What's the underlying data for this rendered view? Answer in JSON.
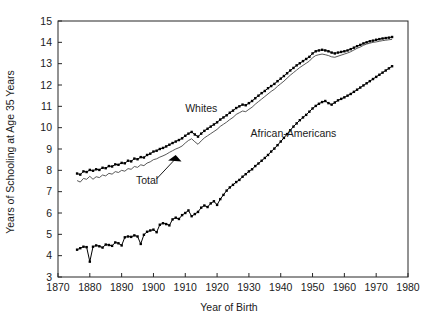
{
  "chart_data": {
    "type": "line",
    "title": "",
    "xlabel": "Year of Birth",
    "ylabel": "Years of Schooling at Age 35 Years",
    "xlim": [
      1870,
      1980
    ],
    "ylim": [
      3,
      15
    ],
    "xticks": [
      1870,
      1880,
      1890,
      1900,
      1910,
      1920,
      1930,
      1940,
      1950,
      1960,
      1970,
      1980
    ],
    "yticks": [
      3,
      4,
      5,
      6,
      7,
      8,
      9,
      10,
      11,
      12,
      13,
      14,
      15
    ],
    "grid": false,
    "legend_position": "inline-annotations",
    "annotations": [
      {
        "text": "Whites",
        "x": 1915,
        "y": 10.75
      },
      {
        "text": "Total",
        "x": 1898,
        "y": 7.35
      },
      {
        "text": "African-Americans",
        "x": 1944,
        "y": 9.55
      }
    ],
    "series": [
      {
        "name": "Whites",
        "marker": "filled-square",
        "x": [
          1876,
          1877,
          1878,
          1879,
          1880,
          1881,
          1882,
          1883,
          1884,
          1885,
          1886,
          1887,
          1888,
          1889,
          1890,
          1891,
          1892,
          1893,
          1894,
          1895,
          1896,
          1897,
          1898,
          1899,
          1900,
          1901,
          1902,
          1903,
          1904,
          1905,
          1906,
          1907,
          1908,
          1909,
          1910,
          1911,
          1912,
          1913,
          1914,
          1915,
          1916,
          1917,
          1918,
          1919,
          1920,
          1921,
          1922,
          1923,
          1924,
          1925,
          1926,
          1927,
          1928,
          1929,
          1930,
          1931,
          1932,
          1933,
          1934,
          1935,
          1936,
          1937,
          1938,
          1939,
          1940,
          1941,
          1942,
          1943,
          1944,
          1945,
          1946,
          1947,
          1948,
          1949,
          1950,
          1951,
          1952,
          1953,
          1954,
          1955,
          1956,
          1957,
          1958,
          1959,
          1960,
          1961,
          1962,
          1963,
          1964,
          1965,
          1966,
          1967,
          1968,
          1969,
          1970,
          1971,
          1972,
          1973,
          1974,
          1975
        ],
        "y": [
          7.85,
          7.8,
          7.95,
          7.92,
          8.02,
          7.98,
          8.05,
          8.02,
          8.12,
          8.1,
          8.2,
          8.18,
          8.28,
          8.26,
          8.35,
          8.33,
          8.45,
          8.42,
          8.55,
          8.52,
          8.62,
          8.6,
          8.72,
          8.78,
          8.88,
          8.92,
          9.0,
          9.05,
          9.12,
          9.2,
          9.28,
          9.35,
          9.42,
          9.5,
          9.62,
          9.72,
          9.8,
          9.68,
          9.58,
          9.72,
          9.85,
          9.95,
          10.05,
          10.15,
          10.25,
          10.38,
          10.48,
          10.58,
          10.7,
          10.8,
          10.92,
          11.0,
          11.08,
          11.05,
          11.15,
          11.25,
          11.38,
          11.5,
          11.62,
          11.72,
          11.85,
          11.95,
          12.05,
          12.18,
          12.3,
          12.42,
          12.55,
          12.68,
          12.8,
          12.92,
          13.02,
          13.12,
          13.22,
          13.32,
          13.48,
          13.58,
          13.62,
          13.65,
          13.62,
          13.58,
          13.52,
          13.48,
          13.52,
          13.55,
          13.58,
          13.62,
          13.68,
          13.75,
          13.82,
          13.88,
          13.95,
          14.0,
          14.05,
          14.08,
          14.12,
          14.15,
          14.18,
          14.2,
          14.22,
          14.25
        ]
      },
      {
        "name": "Total",
        "marker": "none",
        "x": [
          1876,
          1877,
          1878,
          1879,
          1880,
          1881,
          1882,
          1883,
          1884,
          1885,
          1886,
          1887,
          1888,
          1889,
          1890,
          1891,
          1892,
          1893,
          1894,
          1895,
          1896,
          1897,
          1898,
          1899,
          1900,
          1901,
          1902,
          1903,
          1904,
          1905,
          1906,
          1907,
          1908,
          1909,
          1910,
          1911,
          1912,
          1913,
          1914,
          1915,
          1916,
          1917,
          1918,
          1919,
          1920,
          1921,
          1922,
          1923,
          1924,
          1925,
          1926,
          1927,
          1928,
          1929,
          1930,
          1931,
          1932,
          1933,
          1934,
          1935,
          1936,
          1937,
          1938,
          1939,
          1940,
          1941,
          1942,
          1943,
          1944,
          1945,
          1946,
          1947,
          1948,
          1949,
          1950,
          1951,
          1952,
          1953,
          1954,
          1955,
          1956,
          1957,
          1958,
          1959,
          1960,
          1961,
          1962,
          1963,
          1964,
          1965,
          1966,
          1967,
          1968,
          1969,
          1970,
          1971,
          1972,
          1973,
          1974,
          1975
        ],
        "y": [
          7.52,
          7.45,
          7.62,
          7.58,
          7.72,
          7.58,
          7.7,
          7.66,
          7.78,
          7.74,
          7.86,
          7.82,
          7.94,
          7.9,
          8.0,
          7.96,
          8.08,
          8.05,
          8.18,
          8.14,
          8.26,
          8.22,
          8.34,
          8.4,
          8.5,
          8.54,
          8.62,
          8.68,
          8.75,
          8.84,
          8.92,
          9.0,
          9.06,
          9.14,
          9.28,
          9.4,
          9.48,
          9.34,
          9.22,
          9.38,
          9.52,
          9.62,
          9.72,
          9.82,
          9.92,
          10.06,
          10.16,
          10.26,
          10.38,
          10.48,
          10.62,
          10.7,
          10.78,
          10.75,
          10.86,
          10.96,
          11.1,
          11.22,
          11.34,
          11.46,
          11.58,
          11.7,
          11.8,
          11.94,
          12.06,
          12.18,
          12.32,
          12.46,
          12.58,
          12.7,
          12.82,
          12.92,
          13.02,
          13.12,
          13.28,
          13.38,
          13.42,
          13.45,
          13.42,
          13.38,
          13.32,
          13.3,
          13.35,
          13.4,
          13.45,
          13.5,
          13.56,
          13.64,
          13.72,
          13.78,
          13.86,
          13.92,
          13.96,
          14.0,
          14.02,
          14.05,
          14.08,
          14.1,
          14.12,
          14.14
        ]
      },
      {
        "name": "African-Americans",
        "marker": "filled-square",
        "x": [
          1876,
          1877,
          1878,
          1879,
          1880,
          1881,
          1882,
          1883,
          1884,
          1885,
          1886,
          1887,
          1888,
          1889,
          1890,
          1891,
          1892,
          1893,
          1894,
          1895,
          1896,
          1897,
          1898,
          1899,
          1900,
          1901,
          1902,
          1903,
          1904,
          1905,
          1906,
          1907,
          1908,
          1909,
          1910,
          1911,
          1912,
          1913,
          1914,
          1915,
          1916,
          1917,
          1918,
          1919,
          1920,
          1921,
          1922,
          1923,
          1924,
          1925,
          1926,
          1927,
          1928,
          1929,
          1930,
          1931,
          1932,
          1933,
          1934,
          1935,
          1936,
          1937,
          1938,
          1939,
          1940,
          1941,
          1942,
          1943,
          1944,
          1945,
          1946,
          1947,
          1948,
          1949,
          1950,
          1951,
          1952,
          1953,
          1954,
          1955,
          1956,
          1957,
          1958,
          1959,
          1960,
          1961,
          1962,
          1963,
          1964,
          1965,
          1966,
          1967,
          1968,
          1969,
          1970,
          1971,
          1972,
          1973,
          1974,
          1975
        ],
        "y": [
          4.28,
          4.35,
          4.42,
          4.4,
          3.72,
          4.42,
          4.48,
          4.44,
          4.38,
          4.52,
          4.5,
          4.46,
          4.62,
          4.58,
          4.48,
          4.86,
          4.9,
          4.88,
          4.95,
          4.9,
          4.55,
          4.98,
          5.12,
          5.18,
          5.22,
          5.1,
          5.45,
          5.52,
          5.48,
          5.42,
          5.7,
          5.78,
          5.72,
          5.9,
          6.0,
          6.12,
          5.85,
          5.95,
          6.05,
          6.25,
          6.35,
          6.28,
          6.45,
          6.55,
          6.38,
          6.65,
          6.85,
          7.05,
          7.2,
          7.32,
          7.45,
          7.55,
          7.7,
          7.82,
          7.95,
          8.05,
          8.2,
          8.32,
          8.45,
          8.58,
          8.72,
          8.88,
          9.02,
          9.18,
          9.35,
          9.52,
          9.7,
          9.88,
          10.05,
          10.2,
          10.35,
          10.48,
          10.6,
          10.75,
          10.9,
          11.02,
          11.12,
          11.2,
          11.25,
          11.15,
          11.08,
          11.18,
          11.28,
          11.35,
          11.42,
          11.5,
          11.58,
          11.68,
          11.78,
          11.88,
          11.98,
          12.08,
          12.18,
          12.28,
          12.38,
          12.48,
          12.58,
          12.68,
          12.78,
          12.88
        ]
      }
    ]
  }
}
